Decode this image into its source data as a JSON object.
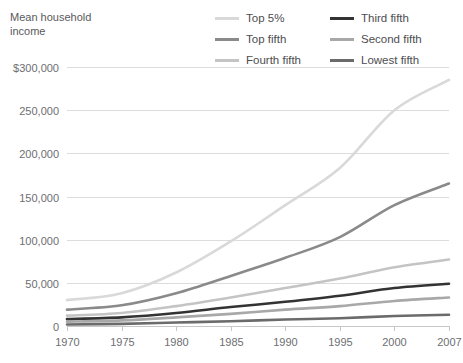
{
  "axis_title": "Mean household\nincome",
  "legend": {
    "items": [
      {
        "label": "Top 5%",
        "color": "#d9d9d9",
        "key": "top5"
      },
      {
        "label": "Third fifth",
        "color": "#333333",
        "key": "third"
      },
      {
        "label": "Top fifth",
        "color": "#8a8a8a",
        "key": "topfifth"
      },
      {
        "label": "Second fifth",
        "color": "#a8a8a8",
        "key": "second"
      },
      {
        "label": "Fourth fifth",
        "color": "#c4c4c4",
        "key": "fourth"
      },
      {
        "label": "Lowest fifth",
        "color": "#6b6b6b",
        "key": "lowest"
      }
    ]
  },
  "chart_data": {
    "type": "line",
    "title": "Mean household income",
    "xlabel": "",
    "ylabel": "Mean household income",
    "x": [
      1970,
      1975,
      1980,
      1985,
      1990,
      1995,
      2000,
      2007
    ],
    "xtick_labels": [
      "1970",
      "1975",
      "1980",
      "1985",
      "1990",
      "1995",
      "2000",
      "2007"
    ],
    "ytick_values": [
      0,
      50000,
      100000,
      150000,
      200000,
      250000,
      300000
    ],
    "ytick_labels": [
      "0",
      "50,000",
      "100,000",
      "150,000",
      "200,000",
      "250,000",
      "$300,000"
    ],
    "ylim": [
      0,
      300000
    ],
    "xlim": [
      1970,
      2007
    ],
    "grid": true,
    "legend_position": "top-right",
    "series": [
      {
        "name": "Top 5%",
        "color": "#d9d9d9",
        "width": 2.6,
        "values": [
          30000,
          38000,
          62000,
          98000,
          140000,
          183000,
          250000,
          285000
        ]
      },
      {
        "name": "Top fifth",
        "color": "#8a8a8a",
        "width": 2.6,
        "values": [
          19000,
          24000,
          38000,
          58000,
          79000,
          103000,
          140000,
          165000
        ]
      },
      {
        "name": "Fourth fifth",
        "color": "#c4c4c4",
        "width": 2.6,
        "values": [
          12000,
          15000,
          23000,
          33000,
          44000,
          55000,
          68000,
          77000
        ]
      },
      {
        "name": "Third fifth",
        "color": "#333333",
        "width": 2.6,
        "values": [
          8000,
          10000,
          15000,
          22000,
          28000,
          35000,
          44000,
          49000
        ]
      },
      {
        "name": "Second fifth",
        "color": "#a8a8a8",
        "width": 2.6,
        "values": [
          5000,
          6500,
          10000,
          14000,
          19000,
          23000,
          29000,
          33000
        ]
      },
      {
        "name": "Lowest fifth",
        "color": "#6b6b6b",
        "width": 2.6,
        "values": [
          1800,
          2500,
          4000,
          5500,
          7500,
          9000,
          11500,
          13000
        ]
      }
    ]
  }
}
